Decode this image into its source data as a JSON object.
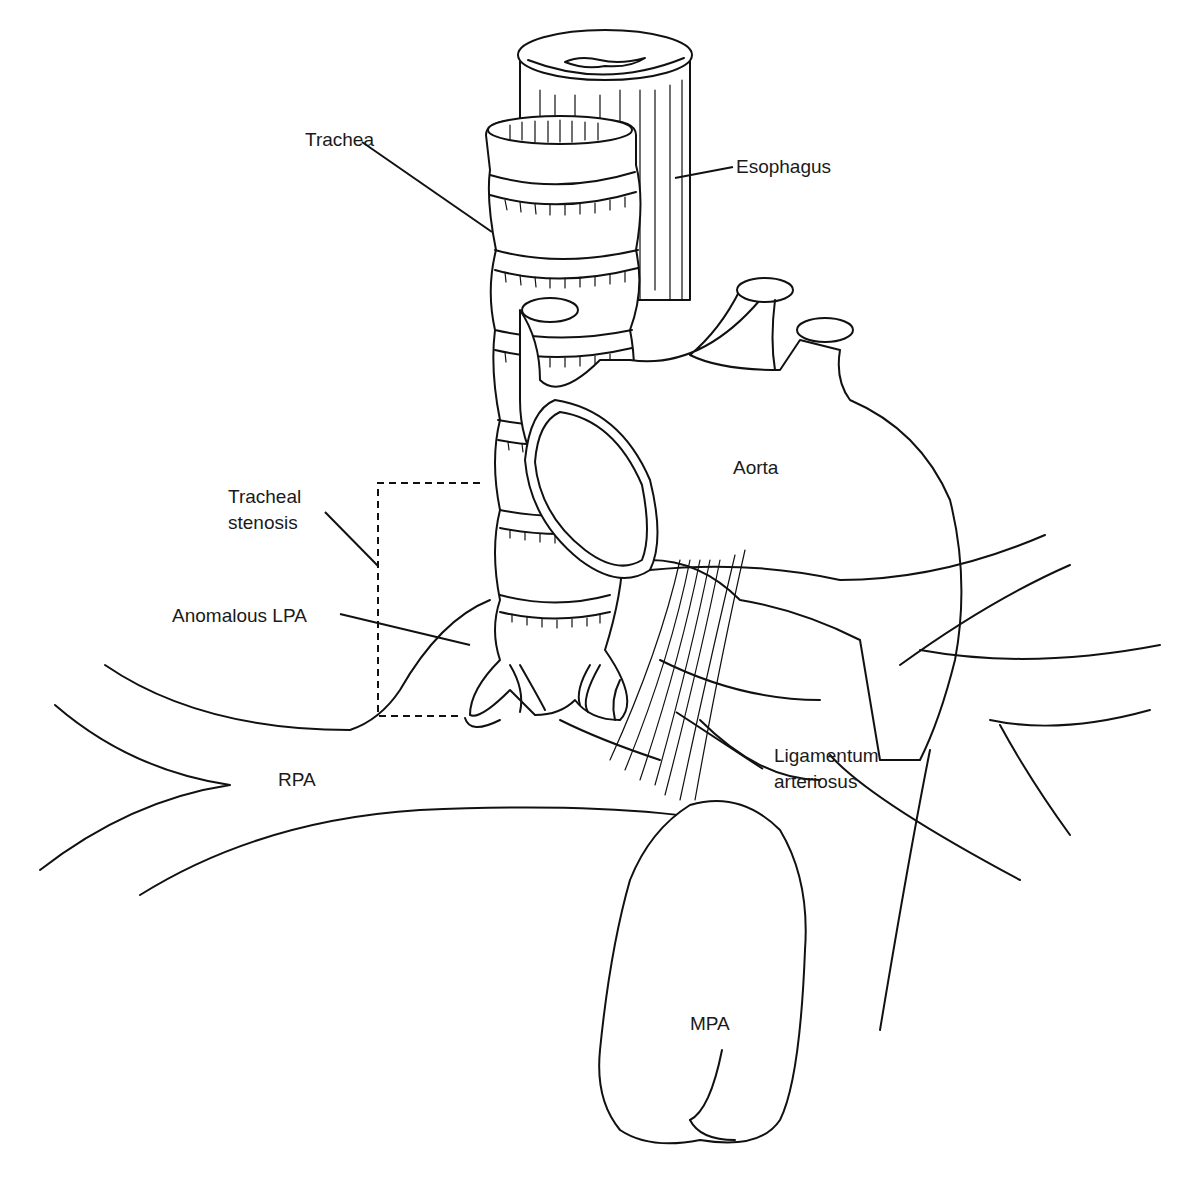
{
  "diagram": {
    "type": "anatomical-illustration",
    "line_color": "#111111",
    "background": "#ffffff"
  },
  "labels": {
    "trachea": "Trachea",
    "esophagus": "Esophagus",
    "aorta": "Aorta",
    "tracheal_stenosis_line1": "Tracheal",
    "tracheal_stenosis_line2": "stenosis",
    "anomalous_lpa": "Anomalous LPA",
    "ligamentum_line1": "Ligamentum",
    "ligamentum_line2": "arteriosus",
    "rpa": "RPA",
    "mpa": "MPA"
  }
}
